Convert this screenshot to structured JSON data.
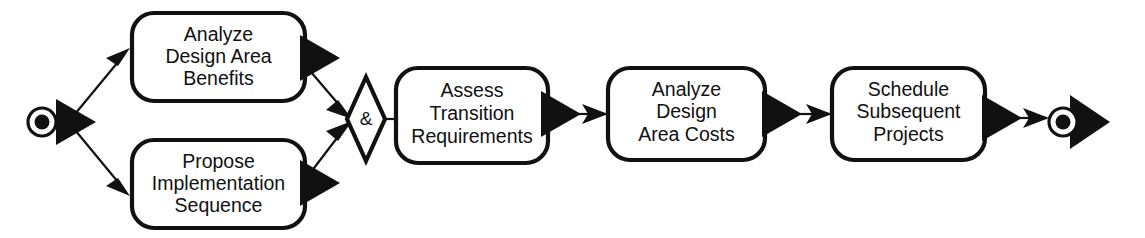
{
  "diagram": {
    "type": "uml-activity-diagram",
    "canvas": {
      "width": 1145,
      "height": 238,
      "background": "#ffffff"
    },
    "colors": {
      "stroke": "#111111",
      "fill": "#ffffff",
      "marker": "#111111"
    },
    "start_node": {
      "name": "start-node",
      "kind": "initial-node",
      "cx": 42,
      "cy": 122,
      "outer_r": 14,
      "inner_r": 7.5
    },
    "end_node": {
      "name": "end-node",
      "kind": "final-node",
      "cx": 1063,
      "cy": 122,
      "outer_r": 14,
      "inner_r": 7.5
    },
    "join_gate": {
      "name": "and-join-gate",
      "label": "&",
      "cx": 366,
      "cy": 119,
      "half_width": 19,
      "half_height": 42
    },
    "activities": [
      {
        "id": "analyze-design-area-benefits",
        "lines": [
          "Analyze",
          "Design Area",
          "Benefits"
        ],
        "x": 132,
        "y": 13,
        "w": 173,
        "h": 88,
        "r": 22
      },
      {
        "id": "propose-implementation-sequence",
        "lines": [
          "Propose",
          "Implementation",
          "Sequence"
        ],
        "x": 132,
        "y": 140,
        "w": 173,
        "h": 88,
        "r": 22
      },
      {
        "id": "assess-transition-requirements",
        "lines": [
          "Assess",
          "Transition",
          "Requirements"
        ],
        "x": 396,
        "y": 68,
        "w": 152,
        "h": 95,
        "r": 22
      },
      {
        "id": "analyze-design-area-costs",
        "lines": [
          "Analyze",
          "Design",
          "Area Costs"
        ],
        "x": 608,
        "y": 68,
        "w": 157,
        "h": 92,
        "r": 22
      },
      {
        "id": "schedule-subsequent-projects",
        "lines": [
          "Schedule",
          "Subsequent",
          "Projects"
        ],
        "x": 832,
        "y": 68,
        "w": 153,
        "h": 92,
        "r": 22
      }
    ],
    "transitions": [
      {
        "id": "start-to-benefits",
        "from": "start-node",
        "to": "analyze-design-area-benefits"
      },
      {
        "id": "start-to-propose",
        "from": "start-node",
        "to": "propose-implementation-sequence"
      },
      {
        "id": "benefits-to-join",
        "from": "analyze-design-area-benefits",
        "to": "and-join-gate"
      },
      {
        "id": "propose-to-join",
        "from": "propose-implementation-sequence",
        "to": "and-join-gate"
      },
      {
        "id": "join-to-assess",
        "from": "and-join-gate",
        "to": "assess-transition-requirements"
      },
      {
        "id": "assess-to-costs",
        "from": "assess-transition-requirements",
        "to": "analyze-design-area-costs"
      },
      {
        "id": "costs-to-schedule",
        "from": "analyze-design-area-costs",
        "to": "schedule-subsequent-projects"
      },
      {
        "id": "schedule-to-end",
        "from": "schedule-subsequent-projects",
        "to": "end-node"
      }
    ]
  }
}
